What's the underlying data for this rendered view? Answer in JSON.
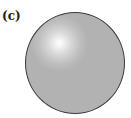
{
  "figure": {
    "panel_label": "(c)",
    "shape": "sphere",
    "colors": {
      "sphere_fill": "#b2b2b2",
      "sphere_outline": "#3a3a3a",
      "highlight": "#ffffff",
      "background": "#ffffff"
    }
  }
}
